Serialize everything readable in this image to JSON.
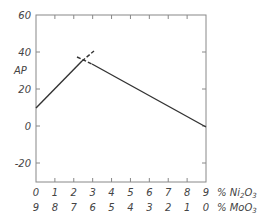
{
  "chart_data": {
    "type": "line",
    "title": "",
    "ylabel": "AP",
    "xlabel_top": "% Ni2O3",
    "xlabel_bottom": "% MoO3",
    "ylim": [
      -30,
      60
    ],
    "xlim": [
      0,
      9
    ],
    "yticks": [
      60,
      40,
      20,
      0,
      -20
    ],
    "xticks_ni2o3": [
      "0",
      "1",
      "2",
      "3",
      "4",
      "5",
      "6",
      "7",
      "8",
      "9"
    ],
    "xticks_moo3": [
      "9",
      "8",
      "7",
      "6",
      "5",
      "4",
      "3",
      "2",
      "1",
      "0"
    ],
    "grid": false,
    "series": [
      {
        "name": "rising branch",
        "x": [
          0,
          2.5,
          3.0
        ],
        "y": [
          10,
          35,
          39
        ],
        "style": "solid then dashed extension"
      },
      {
        "name": "falling branch",
        "x": [
          2.2,
          2.8,
          9
        ],
        "y": [
          37,
          34,
          0
        ],
        "style": "dashed start then solid"
      }
    ],
    "intersection": {
      "x": 2.6,
      "y": 34
    }
  },
  "labels": {
    "y_axis": "AP",
    "x_axis_top_unit": "% Ni",
    "x_axis_top_sub": "2",
    "x_axis_top_tail": "O",
    "x_axis_top_sub2": "3",
    "x_axis_bottom_unit": "% MoO",
    "x_axis_bottom_sub": "3"
  }
}
